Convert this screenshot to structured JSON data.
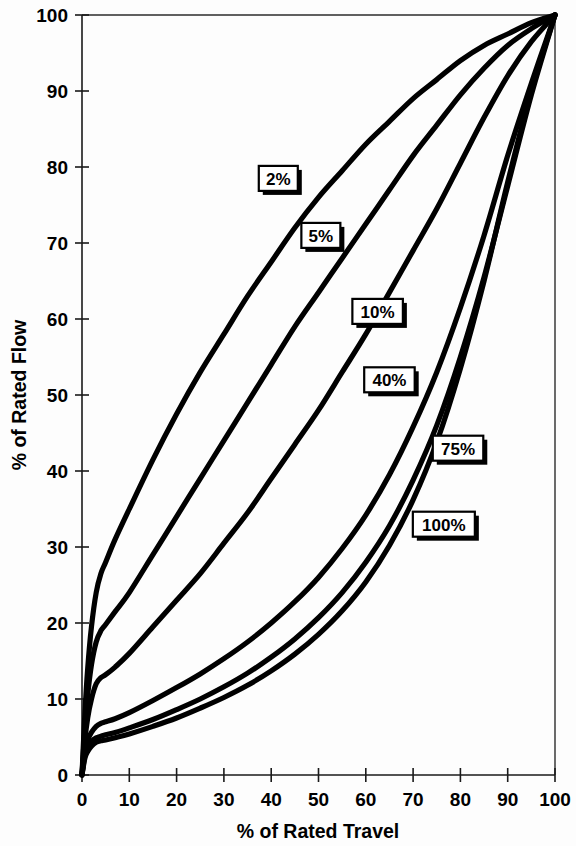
{
  "chart_data": {
    "type": "line",
    "title": "",
    "xlabel": "% of Rated Travel",
    "ylabel": "% of Rated Flow",
    "xlim": [
      0,
      100
    ],
    "ylim": [
      0,
      100
    ],
    "grid": false,
    "legend_position": "inline-callout-labels",
    "x_ticks": [
      0,
      10,
      20,
      30,
      40,
      50,
      60,
      70,
      80,
      90,
      100
    ],
    "y_ticks": [
      0,
      10,
      20,
      30,
      40,
      50,
      60,
      70,
      80,
      90,
      100
    ],
    "x_tick_labels": [
      "0",
      "10",
      "20",
      "30",
      "40",
      "50",
      "60",
      "70",
      "80",
      "90",
      "100"
    ],
    "y_tick_labels": [
      "0",
      "10",
      "20",
      "30",
      "40",
      "50",
      "60",
      "70",
      "80",
      "90",
      "100"
    ],
    "series": [
      {
        "name": "2%",
        "label": "2%",
        "x": [
          0,
          0.6,
          1.2,
          2.0,
          3.0,
          4.0,
          5.0,
          7.0,
          10,
          15,
          20,
          25,
          30,
          35,
          40,
          45,
          50,
          55,
          60,
          65,
          70,
          75,
          80,
          85,
          90,
          95,
          100
        ],
        "y": [
          0,
          8,
          14,
          19.5,
          24,
          26.5,
          28,
          31,
          35,
          41.5,
          47.5,
          53,
          58,
          63,
          67.5,
          72,
          76,
          79.5,
          83,
          86,
          89,
          91.5,
          94,
          96,
          97.5,
          99,
          100
        ]
      },
      {
        "name": "5%",
        "label": "5%",
        "x": [
          0,
          0.6,
          1.2,
          2.0,
          3.0,
          4.0,
          5.0,
          7.0,
          10,
          15,
          20,
          25,
          30,
          35,
          40,
          45,
          50,
          55,
          60,
          65,
          70,
          75,
          80,
          85,
          90,
          95,
          100
        ],
        "y": [
          0,
          6,
          10.5,
          14.5,
          17.5,
          19,
          19.8,
          21.5,
          24,
          29,
          34,
          39,
          44,
          49,
          54,
          59,
          63.5,
          68,
          72.5,
          77,
          81.5,
          85.5,
          89.5,
          93,
          96,
          98.2,
          100
        ]
      },
      {
        "name": "10%",
        "label": "10%",
        "x": [
          0,
          0.6,
          1.2,
          2.0,
          3.0,
          4.0,
          5.0,
          7.0,
          10,
          15,
          20,
          25,
          30,
          35,
          40,
          45,
          50,
          55,
          60,
          65,
          70,
          75,
          80,
          85,
          90,
          95,
          100
        ],
        "y": [
          0,
          4.5,
          7.5,
          10,
          12,
          12.8,
          13.2,
          14.2,
          16,
          19.5,
          23,
          26.5,
          30.5,
          34.5,
          39,
          43.5,
          48,
          53,
          58,
          63.5,
          69,
          74.5,
          80.5,
          86.5,
          92,
          96.5,
          100
        ]
      },
      {
        "name": "40%",
        "label": "40%",
        "x": [
          0,
          0.6,
          1.2,
          2.0,
          3.0,
          4.0,
          5.0,
          7.0,
          10,
          15,
          20,
          25,
          30,
          35,
          40,
          45,
          50,
          55,
          60,
          65,
          70,
          75,
          80,
          85,
          90,
          95,
          100
        ],
        "y": [
          0,
          3.2,
          4.6,
          5.6,
          6.4,
          6.8,
          7.0,
          7.4,
          8.2,
          9.8,
          11.5,
          13.3,
          15.3,
          17.5,
          20,
          22.8,
          26,
          29.8,
          34.2,
          39.5,
          45.8,
          53,
          61.5,
          71,
          81.5,
          91,
          100
        ]
      },
      {
        "name": "75%",
        "label": "75%",
        "x": [
          0,
          0.6,
          1.2,
          2.0,
          3.0,
          4.0,
          5.0,
          7.0,
          10,
          15,
          20,
          25,
          30,
          35,
          40,
          45,
          50,
          55,
          60,
          65,
          70,
          75,
          80,
          85,
          90,
          95,
          100
        ],
        "y": [
          0,
          2.6,
          3.7,
          4.4,
          4.9,
          5.1,
          5.3,
          5.6,
          6.2,
          7.3,
          8.6,
          10.0,
          11.6,
          13.4,
          15.5,
          17.9,
          20.7,
          24.0,
          28.0,
          32.8,
          38.8,
          46.0,
          55.0,
          65.5,
          77.5,
          89.5,
          100
        ]
      },
      {
        "name": "100%",
        "label": "100%",
        "x": [
          0,
          0.6,
          1.2,
          2.0,
          3.0,
          4.0,
          5.0,
          7.0,
          10,
          15,
          20,
          25,
          30,
          35,
          40,
          45,
          50,
          55,
          60,
          65,
          70,
          75,
          80,
          85,
          90,
          95,
          100
        ],
        "y": [
          0,
          2.2,
          3.1,
          3.8,
          4.3,
          4.5,
          4.6,
          4.9,
          5.4,
          6.4,
          7.5,
          8.8,
          10.2,
          11.8,
          13.7,
          15.9,
          18.5,
          21.6,
          25.4,
          30.2,
          36.2,
          43.8,
          53.5,
          65.0,
          78.0,
          90.0,
          100
        ]
      }
    ],
    "annotations": [
      {
        "text": "2%",
        "x": 41.5,
        "y": 78.5
      },
      {
        "text": "5%",
        "x": 50.5,
        "y": 71.0
      },
      {
        "text": "10%",
        "x": 62.5,
        "y": 61.0
      },
      {
        "text": "40%",
        "x": 65.0,
        "y": 52.0
      },
      {
        "text": "75%",
        "x": 79.5,
        "y": 43.0
      },
      {
        "text": "100%",
        "x": 76.5,
        "y": 33.0
      }
    ]
  }
}
